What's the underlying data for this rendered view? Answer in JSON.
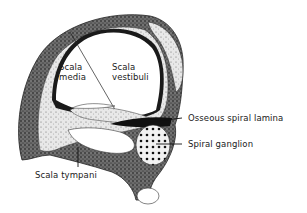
{
  "figure": {
    "labels": {
      "scala_media_line1": "Scala",
      "scala_media_line2": "media",
      "scala_vestibuli_line1": "Scala",
      "scala_vestibuli_line2": "vestibuli",
      "osseous_spiral_lamina": "Osseous spiral lamina",
      "spiral_ganglion": "Spiral ganglion",
      "scala_tympani": "Scala tympani"
    },
    "colors": {
      "ink": "#1a1a1a",
      "tissue": "#3a3a3a",
      "background": "#ffffff"
    }
  }
}
